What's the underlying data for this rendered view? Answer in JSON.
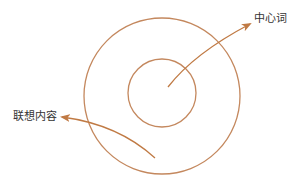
{
  "diagram": {
    "type": "concentric-circles",
    "colors": {
      "stroke": "#C4885E",
      "arrow": "#C07A44",
      "text": "#333333",
      "background": "#FFFFFF"
    },
    "circles": [
      {
        "name": "outer-circle",
        "cx": 162,
        "cy": 96,
        "r": 78
      },
      {
        "name": "inner-circle",
        "cx": 162,
        "cy": 93,
        "r": 34
      }
    ],
    "labels": {
      "center_word": "中心词",
      "association_content": "联想内容"
    },
    "arrows": [
      {
        "name": "center-word-arrow",
        "from": [
          168,
          87
        ],
        "to": [
          251,
          23
        ],
        "points_to": "中心词"
      },
      {
        "name": "association-arrow",
        "from": [
          155,
          158
        ],
        "to": [
          61,
          117
        ],
        "points_to": "联想内容"
      }
    ]
  }
}
